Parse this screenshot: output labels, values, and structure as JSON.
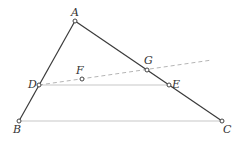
{
  "diagram": {
    "type": "geometry",
    "points": {
      "A": {
        "label": "A",
        "x": 75,
        "y": 21,
        "lx": 71,
        "ly": 16
      },
      "B": {
        "label": "B",
        "x": 19,
        "y": 121,
        "lx": 13,
        "ly": 133
      },
      "C": {
        "label": "C",
        "x": 222,
        "y": 121,
        "lx": 223,
        "ly": 133
      },
      "D": {
        "label": "D",
        "x": 39,
        "y": 85,
        "lx": 28,
        "ly": 88
      },
      "E": {
        "label": "E",
        "x": 169,
        "y": 85,
        "lx": 172,
        "ly": 88
      },
      "F": {
        "label": "F",
        "x": 82,
        "y": 79,
        "lx": 76,
        "ly": 74
      },
      "G": {
        "label": "G",
        "x": 147,
        "y": 70,
        "lx": 144,
        "ly": 64
      }
    },
    "segments": [
      {
        "from": "A",
        "to": "B",
        "style": "solid-dark"
      },
      {
        "from": "A",
        "to": "C",
        "style": "solid-dark"
      },
      {
        "from": "B",
        "to": "C",
        "style": "solid-light"
      },
      {
        "from": "D",
        "to": "E",
        "style": "solid-light"
      },
      {
        "from": "D",
        "to": "G-extended",
        "style": "dashed"
      }
    ],
    "colors": {
      "dark": "#3a3a3a",
      "light": "#c8c8c8",
      "dashed": "#b5b5b5"
    }
  }
}
